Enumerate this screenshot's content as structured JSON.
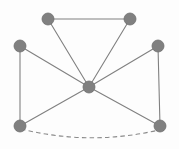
{
  "figure": {
    "background_color": "#fdfdfd",
    "width": 179,
    "height": 149
  },
  "style": {
    "node_fill": "#808080",
    "node_stroke": "#6f6f6f",
    "node_radius": 6,
    "edge_color": "#808080",
    "edge_width": 1.1,
    "dashed_edge_color": "#8a8a8a",
    "dash_pattern": "4.5 3.2"
  },
  "graph": {
    "node_count": 7,
    "edge_count": 10,
    "nodes": [
      {
        "id": "n1",
        "label": "top-left",
        "x": 48,
        "y": 19
      },
      {
        "id": "n2",
        "label": "top-right",
        "x": 130,
        "y": 19
      },
      {
        "id": "n3",
        "label": "mid-left",
        "x": 20,
        "y": 46
      },
      {
        "id": "n4",
        "label": "mid-right",
        "x": 158,
        "y": 46
      },
      {
        "id": "n5",
        "label": "center",
        "x": 89,
        "y": 87
      },
      {
        "id": "n6",
        "label": "bottom-left",
        "x": 20,
        "y": 126
      },
      {
        "id": "n7",
        "label": "bottom-right",
        "x": 160,
        "y": 126
      }
    ],
    "edges": [
      {
        "id": "e1",
        "from": "n1",
        "to": "n2",
        "style": "solid",
        "shape": "straight",
        "path": "M 48 19 L 130 19"
      },
      {
        "id": "e2",
        "from": "n1",
        "to": "n5",
        "style": "solid",
        "shape": "straight",
        "path": "M 48 19 L 89 87"
      },
      {
        "id": "e3",
        "from": "n2",
        "to": "n5",
        "style": "solid",
        "shape": "straight",
        "path": "M 130 19 L 89 87"
      },
      {
        "id": "e4",
        "from": "n3",
        "to": "n5",
        "style": "solid",
        "shape": "straight",
        "path": "M 20 46 L 89 87"
      },
      {
        "id": "e5",
        "from": "n4",
        "to": "n5",
        "style": "solid",
        "shape": "straight",
        "path": "M 158 46 L 89 87"
      },
      {
        "id": "e6",
        "from": "n3",
        "to": "n6",
        "style": "solid",
        "shape": "straight",
        "path": "M 20 46 L 20 126"
      },
      {
        "id": "e7",
        "from": "n4",
        "to": "n7",
        "style": "solid",
        "shape": "straight",
        "path": "M 158 46 L 160 126"
      },
      {
        "id": "e8",
        "from": "n6",
        "to": "n5",
        "style": "solid",
        "shape": "straight",
        "path": "M 20 126 L 89 87"
      },
      {
        "id": "e9",
        "from": "n7",
        "to": "n5",
        "style": "solid",
        "shape": "straight",
        "path": "M 160 126 L 89 87"
      },
      {
        "id": "e10",
        "from": "n6",
        "to": "n7",
        "style": "dashed",
        "shape": "curved-arc-downward",
        "path": "M 21 129 Q 90 146 159 130"
      }
    ]
  }
}
